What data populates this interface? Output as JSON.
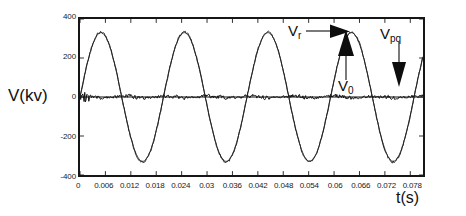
{
  "chart_data": {
    "type": "line",
    "title": "",
    "xlabel": "t(s)",
    "ylabel": "V(kv)",
    "xlim": [
      0,
      0.081
    ],
    "ylim": [
      -400,
      400
    ],
    "grid": false,
    "legend_position": "in-plot annotations",
    "x_ticks": [
      "0",
      "0.006",
      "0.012",
      "0.018",
      "0.024",
      "0.03",
      "0.036",
      "0.042",
      "0.048",
      "0.054",
      "0.06",
      "0.066",
      "0.072",
      "0.078"
    ],
    "x_tick_values": [
      0,
      0.006,
      0.012,
      0.018,
      0.024,
      0.03,
      0.036,
      0.042,
      0.048,
      0.054,
      0.06,
      0.066,
      0.072,
      0.078
    ],
    "y_ticks": [
      "400",
      "200",
      "0",
      "-200",
      "-400"
    ],
    "y_tick_values": [
      400,
      200,
      0,
      -200,
      -400
    ],
    "series": [
      {
        "name": "Vr",
        "label": "V_r",
        "description": "50 Hz reference sinusoidal voltage",
        "color": "#111111",
        "amplitude": 330,
        "frequency_hz": 50.7,
        "phase_offset_s": 0.0,
        "noise": 0,
        "style": "smooth-sine"
      },
      {
        "name": "Vpq",
        "label": "V_pq",
        "description": "Measured series-injected voltage overlaying the reference sinusoid",
        "color": "#222222",
        "amplitude": 333,
        "frequency_hz": 50.7,
        "phase_offset_s": 0.0,
        "noise": 7,
        "style": "noisy-sine"
      },
      {
        "name": "V0",
        "label": "V_0",
        "description": "Near-zero noisy residual voltage trace",
        "color": "#111111",
        "amplitude": 16,
        "frequency_hz": 50.7,
        "noise": 13,
        "style": "noisy-flat"
      }
    ],
    "annotations": [
      {
        "id": "vr",
        "text": "V",
        "sub": "r",
        "arrow": "right",
        "points_to_series": "Vr",
        "x_px": 288,
        "y_px": 23
      },
      {
        "id": "v0",
        "text": "V",
        "sub": "0",
        "arrow": "up",
        "points_to_series": "V0",
        "x_px": 338,
        "y_px": 78
      },
      {
        "id": "vpq",
        "text": "V",
        "sub": "pq",
        "arrow": "down",
        "points_to_series": "Vpq",
        "x_px": 380,
        "y_px": 26
      }
    ]
  },
  "axes": {
    "y_title": "V(kv)",
    "x_title": "t(s)"
  },
  "colors": {
    "frame": "#161616",
    "trace": "#111111",
    "background": "#ffffff",
    "text": "#1a1a1a"
  }
}
